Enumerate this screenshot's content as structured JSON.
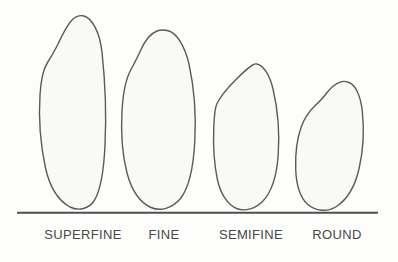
{
  "figure": {
    "labels": [
      "SUPERFINE",
      "FINE",
      "SEMIFINE",
      "ROUND"
    ],
    "colors": {
      "background": "#fdfdfb",
      "shape_fill": "#f9f9f6",
      "outline": "#5a5a5a",
      "baseline": "#4e4e4e",
      "label_text": "#474747"
    }
  }
}
